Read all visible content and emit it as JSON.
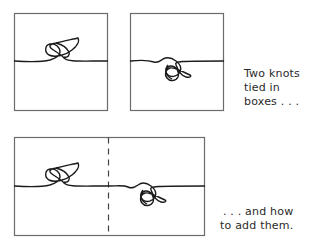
{
  "figure": {
    "top_row": {
      "box_left": {
        "label": "knot-box-1"
      },
      "box_right": {
        "label": "knot-box-2"
      },
      "caption_lines": [
        "Two knots",
        "tied in",
        "boxes . . ."
      ]
    },
    "bottom_row": {
      "box_combined": {
        "label": "knot-sum-box",
        "divider": "dashed"
      },
      "caption_lines": [
        ". . . and how",
        "to add them."
      ]
    },
    "colors": {
      "stroke": "#1a1a1a",
      "box": "#6b6b6b",
      "background": "#ffffff"
    }
  }
}
